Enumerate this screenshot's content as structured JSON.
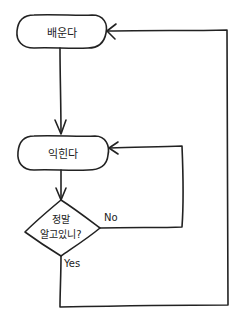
{
  "diagram": {
    "type": "flowchart",
    "style": "hand-drawn",
    "stroke_color": "#222222",
    "background": "#ffffff",
    "nodes": [
      {
        "id": "learn",
        "shape": "terminal",
        "label": "배운다"
      },
      {
        "id": "practice",
        "shape": "terminal",
        "label": "익힌다"
      },
      {
        "id": "check",
        "shape": "decision",
        "label_line1": "정말",
        "label_line2": "알고있니?"
      }
    ],
    "edges": [
      {
        "from": "learn",
        "to": "practice",
        "label": ""
      },
      {
        "from": "practice",
        "to": "check",
        "label": ""
      },
      {
        "from": "check",
        "to": "practice",
        "label": "No"
      },
      {
        "from": "check",
        "to": "learn",
        "label": "Yes"
      }
    ]
  }
}
